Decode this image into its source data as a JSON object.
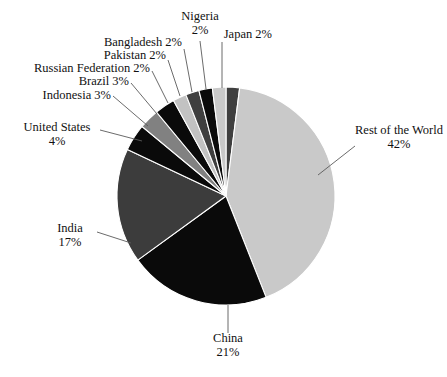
{
  "chart_data": {
    "type": "pie",
    "title": "",
    "subtitle": "",
    "xlabel": "",
    "ylabel": "",
    "legend_position": "none",
    "grid": false,
    "units": "%",
    "label_format": "{name} {value}%",
    "start_angle_deg": 0,
    "direction": "clockwise",
    "categories": [
      "Japan",
      "Rest of the World",
      "China",
      "India",
      "United States",
      "Indonesia",
      "Brazil",
      "Russian Federation",
      "Pakistan",
      "Bangladesh",
      "Nigeria"
    ],
    "values": [
      2,
      42,
      21,
      17,
      4,
      3,
      3,
      2,
      2,
      2,
      2
    ],
    "colors": [
      "#3f3f3f",
      "#c9c9c9",
      "#0a0a0a",
      "#3c3c3c",
      "#0a0a0a",
      "#818181",
      "#0a0a0a",
      "#c2c2c2",
      "#3f3f3f",
      "#0a0a0a",
      "#c9c9c9"
    ],
    "slices": [
      {
        "name": "Japan",
        "value": 2,
        "value_text": "2%",
        "color": "#3f3f3f"
      },
      {
        "name": "Rest of the World",
        "value": 42,
        "value_text": "42%",
        "color": "#c9c9c9"
      },
      {
        "name": "China",
        "value": 21,
        "value_text": "21%",
        "color": "#0a0a0a"
      },
      {
        "name": "India",
        "value": 17,
        "value_text": "17%",
        "color": "#3c3c3c"
      },
      {
        "name": "United States",
        "value": 4,
        "value_text": "4%",
        "color": "#0a0a0a"
      },
      {
        "name": "Indonesia",
        "value": 3,
        "value_text": "3%",
        "color": "#818181"
      },
      {
        "name": "Brazil",
        "value": 3,
        "value_text": "3%",
        "color": "#0a0a0a"
      },
      {
        "name": "Russian Federation",
        "value": 2,
        "value_text": "2%",
        "color": "#c2c2c2"
      },
      {
        "name": "Pakistan",
        "value": 2,
        "value_text": "2%",
        "color": "#3f3f3f"
      },
      {
        "name": "Bangladesh",
        "value": 2,
        "value_text": "2%",
        "color": "#0a0a0a"
      },
      {
        "name": "Nigeria",
        "value": 2,
        "value_text": "2%",
        "color": "#c9c9c9"
      }
    ]
  },
  "labels": {
    "rest_of_world": {
      "name": "Rest of the World",
      "value_text": "42%"
    },
    "china": {
      "name": "China",
      "value_text": "21%"
    },
    "india": {
      "name": "India",
      "value_text": "17%"
    },
    "united_states": {
      "name": "United States",
      "value_text": "4%"
    },
    "indonesia": {
      "text": "Indonesia 3%"
    },
    "brazil": {
      "text": "Brazil 3%"
    },
    "russian_federation": {
      "text": "Russian Federation 2%"
    },
    "pakistan": {
      "text": "Pakistan 2%"
    },
    "bangladesh": {
      "text": "Bangladesh 2%"
    },
    "nigeria": {
      "name": "Nigeria",
      "value_text": "2%"
    },
    "japan": {
      "text": "Japan 2%"
    }
  },
  "style": {
    "background": "#ffffff",
    "text_color": "#111111",
    "leader_line_color": "#5a5a5a"
  }
}
